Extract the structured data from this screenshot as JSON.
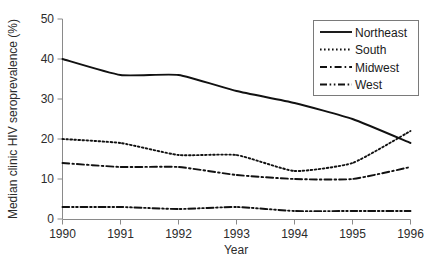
{
  "chart_data": {
    "type": "line",
    "title": "",
    "xlabel": "Year",
    "ylabel": "Median clinic HIV seroprevalence (%)",
    "x": [
      1990,
      1991,
      1992,
      1993,
      1994,
      1995,
      1996
    ],
    "xticklabels": [
      "1990",
      "1991",
      "1992",
      "1993",
      "1994",
      "1995",
      "1996"
    ],
    "yticklabels": [
      "0",
      "10",
      "20",
      "30",
      "40",
      "50"
    ],
    "yticks": [
      0,
      10,
      20,
      30,
      40,
      50
    ],
    "xlim": [
      1990,
      1996
    ],
    "ylim": [
      0,
      50
    ],
    "grid": false,
    "legend_position": "top-right",
    "series": [
      {
        "name": "Northeast",
        "style": "solid",
        "color": "#111111",
        "values": [
          40.0,
          36.0,
          36.0,
          32.0,
          29.0,
          25.0,
          19.0
        ]
      },
      {
        "name": "South",
        "style": "dotted",
        "color": "#111111",
        "values": [
          20.0,
          19.0,
          16.0,
          16.0,
          12.0,
          14.0,
          22.0
        ]
      },
      {
        "name": "Midwest",
        "style": "dash-dot",
        "color": "#111111",
        "values": [
          14.0,
          13.0,
          13.0,
          11.0,
          10.0,
          10.0,
          13.0
        ]
      },
      {
        "name": "West",
        "style": "dash-dot-dot",
        "color": "#111111",
        "values": [
          3.0,
          3.0,
          2.5,
          3.0,
          2.0,
          2.0,
          2.0
        ]
      }
    ]
  },
  "legend": {
    "items": [
      {
        "label": "Northeast"
      },
      {
        "label": "South"
      },
      {
        "label": "Midwest"
      },
      {
        "label": "West"
      }
    ]
  },
  "axes": {
    "y_title": "Median clinic HIV seroprevalence (%)",
    "x_title": "Year"
  }
}
